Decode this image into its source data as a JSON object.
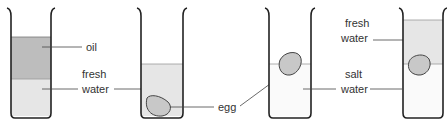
{
  "diagram": {
    "beakers": [
      {
        "id": "beaker-1",
        "layers": [
          "oil",
          "fresh water"
        ],
        "egg": "none"
      },
      {
        "id": "beaker-2",
        "layers": [
          "fresh water"
        ],
        "egg": "sinks to bottom"
      },
      {
        "id": "beaker-3",
        "layers": [
          "salt water"
        ],
        "egg": "floats at surface"
      },
      {
        "id": "beaker-4",
        "layers": [
          "fresh water",
          "salt water"
        ],
        "egg": "floats at boundary"
      }
    ],
    "labels": {
      "oil": "oil",
      "fresh_1": "fresh",
      "water_1": "water",
      "egg": "egg",
      "salt": "salt",
      "water_3": "water",
      "fresh_4": "fresh",
      "water_4": "water"
    },
    "colors": {
      "oil": "#bdbdbd",
      "fresh_water": "#e6e6e6",
      "salt_water": "#fafafa",
      "egg": "#c8c8c8",
      "outline": "#222222"
    }
  }
}
